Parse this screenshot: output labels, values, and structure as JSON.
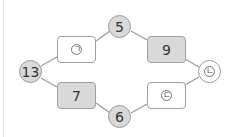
{
  "diagram": {
    "nodes": [
      {
        "id": "left",
        "shape": "circle",
        "label": "13",
        "filled": true
      },
      {
        "id": "top",
        "shape": "circle",
        "label": "5",
        "filled": true
      },
      {
        "id": "bottom",
        "shape": "circle",
        "label": "6",
        "filled": true
      },
      {
        "id": "right",
        "shape": "circle",
        "label": "ㄴ",
        "filled": false,
        "blank": true
      },
      {
        "id": "upper-left-box",
        "shape": "box",
        "label": "ㄱ",
        "filled": false,
        "blank": true
      },
      {
        "id": "upper-right-box",
        "shape": "box",
        "label": "9",
        "filled": true
      },
      {
        "id": "lower-left-box",
        "shape": "box",
        "label": "7",
        "filled": true
      },
      {
        "id": "lower-right-box",
        "shape": "box",
        "label": "ㄷ",
        "filled": false,
        "blank": true
      }
    ],
    "colors": {
      "fill": "#d9d9d9",
      "stroke": "#9a9a9a",
      "line": "#9a9a9a"
    }
  }
}
